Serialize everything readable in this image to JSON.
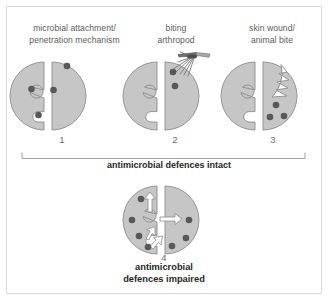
{
  "figure": {
    "background_color": "#ffffff",
    "frame_color": "#d9d9d9",
    "tissue_fill": "#c6c6c6",
    "tissue_stroke": "#8c8c8c",
    "microbe_color": "#585858",
    "arrow_color": "#ffffff",
    "caption_color": "#5c5c5c",
    "bold_text_color": "#262626"
  },
  "panels": [
    {
      "number": "1",
      "caption_lines": [
        "microbial attachment/",
        "penetration mechanism"
      ],
      "mechanism": "attachment-penetration",
      "microbe_count": 4
    },
    {
      "number": "2",
      "caption_lines": [
        "biting",
        "arthropod"
      ],
      "mechanism": "arthropod-bite",
      "microbe_count": 2,
      "vector_icon": "biting-arthropod-icon"
    },
    {
      "number": "3",
      "caption_lines": [
        "skin wound/",
        "animal bite"
      ],
      "mechanism": "wound-bite",
      "microbe_count": 3,
      "wound_icon": "jagged-wound-icon"
    }
  ],
  "bracket": {
    "label": "antimicrobial defences intact"
  },
  "bottom_panel": {
    "number": "4",
    "caption_lines": [
      "antimicrobial",
      "defences impaired"
    ],
    "mechanism": "defences-impaired",
    "microbe_count": 7,
    "arrow_count": 4
  }
}
